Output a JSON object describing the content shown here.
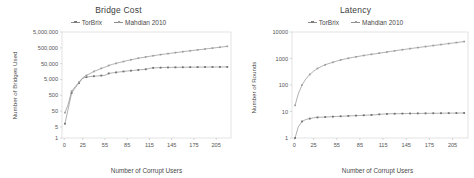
{
  "figure": {
    "panels": [
      {
        "id": "bridge-cost",
        "title": "Bridge Cost",
        "legend": [
          {
            "label": "TorBrix",
            "marker": "cross"
          },
          {
            "label": "Mahdian 2010",
            "marker": "square"
          }
        ],
        "xlabel": "Number of Corrupt Users",
        "ylabel": "Number of Bridges Used"
      },
      {
        "id": "latency",
        "title": "Latency",
        "legend": [
          {
            "label": "TorBrix",
            "marker": "cross"
          },
          {
            "label": "Mahdian 2010",
            "marker": "square"
          }
        ],
        "xlabel": "Number of Corrupt Users",
        "ylabel": "Number of Rounds"
      }
    ]
  },
  "chart_data": [
    {
      "type": "line",
      "id": "bridge-cost",
      "title": "Bridge Cost",
      "xlabel": "Number of Corrupt Users",
      "ylabel": "Number of Bridges Used",
      "yscale": "log",
      "ylim": [
        1,
        5000000
      ],
      "yticks": [
        1,
        5,
        50,
        500,
        5000,
        50000,
        500000,
        5000000
      ],
      "ytick_labels": [
        "1",
        "5",
        "50",
        "500",
        "5,000",
        "50,000",
        "500,000",
        "5,000,000"
      ],
      "xlim": [
        -3,
        225
      ],
      "xticks": [
        0,
        25,
        55,
        85,
        115,
        145,
        175,
        205
      ],
      "xtick_labels": [
        "0",
        "25",
        "55",
        "85",
        "115",
        "145",
        "175",
        "205"
      ],
      "grid": false,
      "legend_position": "top-center",
      "x": [
        1,
        5,
        10,
        15,
        20,
        25,
        30,
        35,
        40,
        45,
        50,
        55,
        60,
        65,
        70,
        75,
        80,
        85,
        90,
        95,
        100,
        105,
        110,
        115,
        120,
        125,
        130,
        135,
        140,
        145,
        150,
        155,
        160,
        165,
        170,
        175,
        180,
        185,
        190,
        195,
        200,
        205,
        210,
        215,
        220
      ],
      "series": [
        {
          "name": "TorBrix",
          "marker": "cross",
          "values": [
            8,
            60,
            700,
            1500,
            3000,
            6000,
            7000,
            7600,
            8000,
            8400,
            8800,
            9200,
            12000,
            13000,
            14000,
            15000,
            16000,
            17000,
            18000,
            19000,
            20000,
            21000,
            22000,
            25000,
            27000,
            27500,
            28000,
            28500,
            28800,
            29000,
            29200,
            29400,
            29600,
            29800,
            30000,
            30100,
            30200,
            30300,
            30400,
            30500,
            30600,
            30700,
            30800,
            30900,
            31000
          ]
        },
        {
          "name": "Mahdian 2010",
          "marker": "square",
          "values": [
            40,
            120,
            900,
            1800,
            3400,
            6500,
            9000,
            12000,
            16000,
            20000,
            25000,
            30000,
            38000,
            45000,
            52000,
            60000,
            68000,
            78000,
            88000,
            98000,
            110000,
            120000,
            132000,
            145000,
            158000,
            172000,
            186000,
            200000,
            215000,
            230000,
            248000,
            265000,
            285000,
            305000,
            325000,
            348000,
            370000,
            395000,
            420000,
            450000,
            480000,
            510000,
            545000,
            580000,
            620000
          ]
        }
      ]
    },
    {
      "type": "line",
      "id": "latency",
      "title": "Latency",
      "xlabel": "Number of Corrupt Users",
      "ylabel": "Number of Rounds",
      "yscale": "log",
      "ylim": [
        1,
        10000
      ],
      "yticks": [
        1,
        10,
        100,
        1000,
        10000
      ],
      "ytick_labels": [
        "1",
        "10",
        "100",
        "1000",
        "10000"
      ],
      "xlim": [
        -3,
        225
      ],
      "xticks": [
        0,
        25,
        55,
        85,
        115,
        145,
        175,
        205
      ],
      "xtick_labels": [
        "0",
        "25",
        "55",
        "85",
        "115",
        "145",
        "175",
        "205"
      ],
      "grid": false,
      "legend_position": "top-center",
      "x": [
        1,
        5,
        10,
        15,
        20,
        25,
        30,
        35,
        40,
        45,
        50,
        55,
        60,
        65,
        70,
        75,
        80,
        85,
        90,
        95,
        100,
        105,
        110,
        115,
        120,
        125,
        130,
        135,
        140,
        145,
        150,
        155,
        160,
        165,
        170,
        175,
        180,
        185,
        190,
        195,
        200,
        205,
        210,
        215,
        220
      ],
      "series": [
        {
          "name": "TorBrix",
          "marker": "cross",
          "values": [
            1.0,
            2.6,
            4.2,
            5.0,
            5.4,
            5.8,
            6.0,
            6.1,
            6.2,
            6.3,
            6.4,
            6.5,
            6.6,
            6.7,
            6.8,
            6.9,
            7.0,
            7.1,
            7.2,
            7.3,
            7.4,
            7.5,
            7.8,
            8.0,
            8.1,
            8.2,
            8.25,
            8.3,
            8.35,
            8.4,
            8.42,
            8.45,
            8.48,
            8.5,
            8.52,
            8.55,
            8.58,
            8.6,
            8.62,
            8.65,
            8.68,
            8.7,
            8.72,
            8.75,
            8.8
          ]
        },
        {
          "name": "Mahdian 2010",
          "marker": "square",
          "values": [
            17,
            45,
            100,
            170,
            250,
            330,
            420,
            500,
            580,
            650,
            720,
            800,
            880,
            950,
            1020,
            1090,
            1160,
            1230,
            1300,
            1370,
            1440,
            1510,
            1590,
            1670,
            1760,
            1850,
            1950,
            2050,
            2150,
            2250,
            2360,
            2470,
            2580,
            2700,
            2820,
            2950,
            3080,
            3220,
            3360,
            3500,
            3660,
            3820,
            3990,
            4160,
            4350
          ]
        }
      ]
    }
  ]
}
